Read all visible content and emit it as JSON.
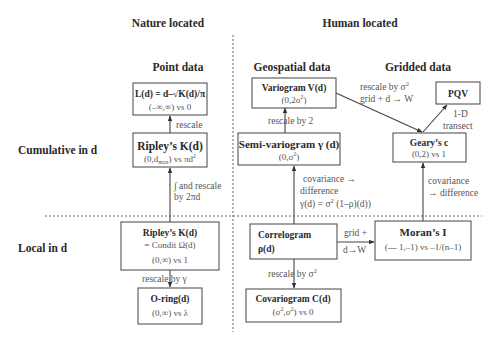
{
  "headers": {
    "nature_located": "Nature located",
    "human_located": "Human located",
    "point_data": "Point data",
    "geospatial_data": "Geospatial data",
    "gridded_data": "Gridded data",
    "cumulative_in_d": "Cumulative in d",
    "local_in_d": "Local in d"
  },
  "nodes": {
    "ld": {
      "title": "L(d) = d–√K(d)/π",
      "range": "(–∞,∞) vs 0"
    },
    "ripley_cum": {
      "title": "Ripley’s K(d)",
      "range_pre": "(0,d",
      "range_sub": "max",
      "range_post": ") vs πd",
      "range_sup": "2"
    },
    "ripley_local": {
      "title": "Ripley’s K(d)",
      "line2": "= Condit Ω(d)",
      "range": "(0,∞) vs 1"
    },
    "oring": {
      "title": "O-ring(d)",
      "range": "(0,∞) vs λ"
    },
    "variogram": {
      "title": "Variogram V(d)",
      "range_pre": "(0,2σ",
      "range_sup": "2",
      "range_post": ")"
    },
    "semivariogram": {
      "title": "Semi-variogram γ (d)",
      "range_pre": "(0,σ",
      "range_sup": "2",
      "range_post": ")"
    },
    "correlogram": {
      "title": "Correlogram",
      "line2": "ρ(d)"
    },
    "covariogram": {
      "title": "Covariogram C(d)",
      "range_a": "(σ",
      "range_sup1": "2",
      "range_b": ",σ",
      "range_sup2": "2",
      "range_c": ") vs 0"
    },
    "pqv": {
      "title": "PQV"
    },
    "geary": {
      "title": "Geary’s c",
      "range": "(0,2) vs 1"
    },
    "moran": {
      "title": "Moran’s I",
      "range": "(— 1,–1) vs –1/(n–1)"
    }
  },
  "edges": {
    "k_to_l": "rescale",
    "kl_to_kc_1": "∫ and rescale",
    "kl_to_kc_2": "by 2πd",
    "kl_to_oring": "rescale by γ",
    "semi_to_vario": "rescale by 2",
    "corr_to_semi_1": "covariance →",
    "corr_to_semi_2": "difference",
    "corr_to_semi_3_pre": "γ(d) = σ",
    "corr_to_semi_3_sup": "2",
    "corr_to_semi_3_post": " (1–ρ)(d))",
    "corr_to_cov_pre": "rescale by σ",
    "corr_to_cov_sup": "2",
    "vario_to_geary_1_pre": "rescale by σ",
    "vario_to_geary_1_sup": "2",
    "vario_to_geary_2": "grid + d → W",
    "geary_to_pqv_1": "1-D",
    "geary_to_pqv_2": "transect",
    "moran_to_geary_1": "covariance",
    "moran_to_geary_2": "→ difference",
    "corr_to_moran_1": "grid +",
    "corr_to_moran_2": "d→W"
  }
}
